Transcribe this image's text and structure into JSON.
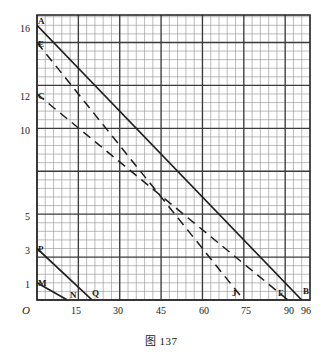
{
  "figure": {
    "caption": "图 137",
    "origin_label": "O"
  },
  "chart_data": {
    "type": "line",
    "title": "图 137",
    "xlabel": "",
    "ylabel": "",
    "xlim": [
      0,
      99
    ],
    "ylim": [
      0,
      16.6
    ],
    "grid": true,
    "grid_minor_x_step": 3,
    "grid_major_x_step": 15,
    "grid_minor_y_step": 0.5,
    "grid_major_y_step": 2.5,
    "legend": "none",
    "x_ticks": [
      0,
      15,
      30,
      45,
      60,
      75,
      90,
      96
    ],
    "x_tick_labels": [
      "O",
      "15",
      "30",
      "45",
      "60",
      "75",
      "90",
      "96"
    ],
    "y_ticks": [
      1,
      3,
      5,
      10,
      12,
      16
    ],
    "y_tick_labels": [
      "1",
      "3",
      "5",
      "10",
      "12",
      "16"
    ],
    "series": [
      {
        "name": "AB",
        "style": "solid",
        "from_point": "A",
        "to_point": "B",
        "x": [
          0,
          96
        ],
        "y": [
          16,
          0
        ]
      },
      {
        "name": "EJ",
        "style": "dashed",
        "from_point": "E",
        "to_point": "J",
        "x": [
          0,
          75
        ],
        "y": [
          15,
          0
        ]
      },
      {
        "name": "CF",
        "style": "dashed",
        "from_point": "C",
        "to_point": "F",
        "x": [
          0,
          91
        ],
        "y": [
          12,
          0
        ]
      },
      {
        "name": "PQ",
        "style": "solid",
        "from_point": "P",
        "to_point": "Q",
        "x": [
          0,
          20
        ],
        "y": [
          3,
          0
        ]
      },
      {
        "name": "MN",
        "style": "solid",
        "from_point": "M",
        "to_point": "N",
        "x": [
          0,
          11
        ],
        "y": [
          1,
          0
        ]
      }
    ],
    "annotations": [
      {
        "label": "A",
        "x": 0,
        "y": 16
      },
      {
        "label": "E",
        "x": 0,
        "y": 15
      },
      {
        "label": "C",
        "x": 0,
        "y": 12
      },
      {
        "label": "P",
        "x": 0,
        "y": 3
      },
      {
        "label": "M",
        "x": 0,
        "y": 1
      },
      {
        "label": "N",
        "x": 11,
        "y": 0
      },
      {
        "label": "Q",
        "x": 20,
        "y": 0
      },
      {
        "label": "J",
        "x": 75,
        "y": 0
      },
      {
        "label": "F",
        "x": 91,
        "y": 0
      },
      {
        "label": "B",
        "x": 96,
        "y": 0
      }
    ]
  }
}
